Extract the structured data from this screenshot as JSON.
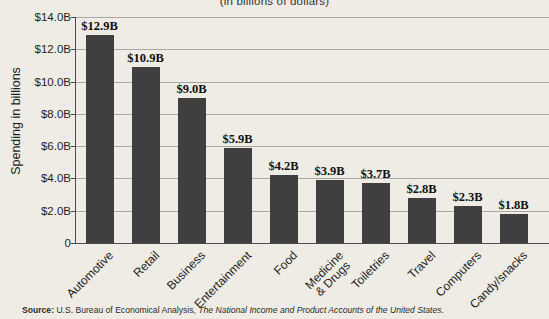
{
  "chart_data": {
    "type": "bar",
    "title": "(in billions of dollars)",
    "ylabel": "Spending in billions",
    "xlabel": "",
    "categories": [
      "Automotive",
      "Retail",
      "Business",
      "Entertainment",
      "Food",
      "Medicine\n& Drugs",
      "Toiletries",
      "Travel",
      "Computers",
      "Candy/snacks"
    ],
    "values": [
      12.9,
      10.9,
      9.0,
      5.9,
      4.2,
      3.9,
      3.7,
      2.8,
      2.3,
      1.8
    ],
    "bar_labels": [
      "$12.9B",
      "$10.9B",
      "$9.0B",
      "$5.9B",
      "$4.2B",
      "$3.9B",
      "$3.7B",
      "$2.8B",
      "$2.3B",
      "$1.8B"
    ],
    "y_ticks": [
      {
        "value": 14,
        "label": "$14.0B"
      },
      {
        "value": 12,
        "label": "$12.0B"
      },
      {
        "value": 10,
        "label": "$10.0B"
      },
      {
        "value": 8,
        "label": "$8.0B"
      },
      {
        "value": 6,
        "label": "$6.0B"
      },
      {
        "value": 4,
        "label": "$4.0B"
      },
      {
        "value": 2,
        "label": "$2.0B"
      },
      {
        "value": 0,
        "label": "0"
      }
    ],
    "ylim": [
      0,
      14
    ],
    "grid": true,
    "legend": "none",
    "bar_color": "#3f3f3f",
    "background_color": "#eeece4",
    "gridline_color": "#a9a7a0"
  },
  "source": {
    "prefix": "Source:",
    "body": " U.S. Bureau of Economical Analysis, ",
    "work": "The National Income and Product Accounts of the United States."
  }
}
